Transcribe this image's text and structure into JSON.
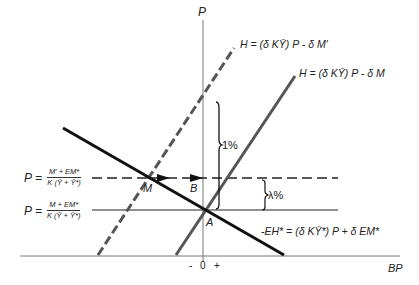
{
  "axes": {
    "y_label": "P",
    "x_label": "BP",
    "x_ticks": [
      "-",
      "0",
      "+"
    ]
  },
  "curves": {
    "h_dashed": "H = (δ KȲ) P - δ M′",
    "h_solid": "H = (δ KȲ) P - δ M",
    "eh_line": "-EH* = (δ KȲ*) P + δ EM*"
  },
  "levels": {
    "upper": {
      "p": "P =",
      "numerator": "M′ + EM*",
      "denominator": "K (Ȳ + Ȳ*)"
    },
    "lower": {
      "p": "P =",
      "numerator": "M + EM*",
      "denominator": "K (Ȳ + Ȳ*)"
    }
  },
  "points": {
    "m": "M",
    "b": "B",
    "a": "A"
  },
  "brackets": {
    "one_pct": "1%",
    "lambda_pct": "λ%"
  },
  "colors": {
    "black": "#111111",
    "grey": "#555555",
    "axis": "#777777"
  }
}
